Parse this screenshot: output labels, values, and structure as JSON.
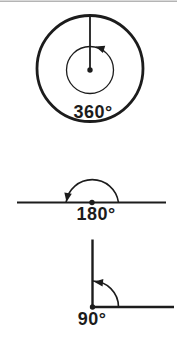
{
  "canvas": {
    "background": "#ffffff",
    "ink_color": "#1c1c1c",
    "top_rule_color": "#b4b4b4"
  },
  "figures": [
    {
      "name": "full-rotation",
      "label": "360°",
      "angle_degrees": 360,
      "description": "circle with radius line and counterclockwise full-turn arrow"
    },
    {
      "name": "straight-angle",
      "label": "180°",
      "angle_degrees": 180,
      "description": "semicircular arc over a straight line with arrow at left end"
    },
    {
      "name": "right-angle",
      "label": "90°",
      "angle_degrees": 90,
      "description": "quarter arc between horizontal ray and vertical ray with arrow at top"
    }
  ]
}
